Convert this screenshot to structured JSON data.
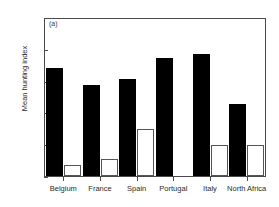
{
  "chart_data": {
    "type": "bar",
    "title": "",
    "panel_label": "(a)",
    "xlabel": "",
    "ylabel": "Mean hunting index",
    "ylim": [
      0,
      100
    ],
    "yticks": [
      0,
      20,
      40,
      60,
      80,
      100
    ],
    "grid": false,
    "legend": null,
    "categories": [
      "Belgium",
      "France",
      "Spain",
      "Portugal",
      "Italy",
      "North Africa"
    ],
    "series": [
      {
        "name": "solid",
        "style": "filled-black",
        "color": "#000000",
        "values": [
          69,
          58,
          62,
          75,
          78,
          46
        ]
      },
      {
        "name": "open",
        "style": "open-outline",
        "color": "#ffffff",
        "edgecolor": "#555555",
        "values": [
          7,
          11,
          30,
          0,
          20,
          20
        ]
      }
    ]
  },
  "axis": {
    "tick_labels": [
      "100",
      "80",
      "60",
      "40",
      "20",
      "0"
    ],
    "frame_color": "#4a4a4a"
  }
}
